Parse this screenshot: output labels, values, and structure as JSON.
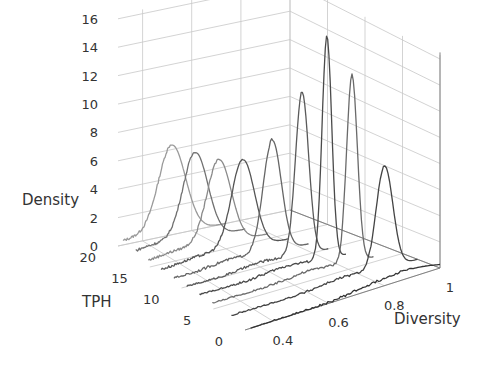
{
  "chart_data": {
    "type": "line",
    "subtype": "3d-waterfall-density",
    "title": "",
    "axes": {
      "z": {
        "label": "Density",
        "ticks": [
          0,
          2,
          4,
          6,
          8,
          10,
          12,
          14,
          16
        ],
        "range": [
          0,
          16.5
        ]
      },
      "y": {
        "label": "TPH",
        "ticks": [
          0,
          5,
          10,
          15,
          20
        ],
        "range": [
          0,
          20
        ]
      },
      "x": {
        "label": "Diversity",
        "ticks": [
          0.4,
          0.6,
          0.8,
          1
        ],
        "range": [
          0.3,
          1.0
        ]
      }
    },
    "grid": true,
    "legend": null,
    "series": [
      {
        "tph": 20,
        "peak_x": 0.52,
        "peak_density": 6.3,
        "width": 0.055,
        "color": "#9a9a9a"
      },
      {
        "tph": 18,
        "peak_x": 0.56,
        "peak_density": 6.2,
        "width": 0.05,
        "color": "#707070"
      },
      {
        "tph": 16,
        "peak_x": 0.6,
        "peak_density": 6.1,
        "width": 0.048,
        "color": "#8a8a8a"
      },
      {
        "tph": 14,
        "peak_x": 0.64,
        "peak_density": 6.5,
        "width": 0.045,
        "color": "#555555"
      },
      {
        "tph": 12,
        "peak_x": 0.7,
        "peak_density": 8.2,
        "width": 0.035,
        "color": "#666666"
      },
      {
        "tph": 10,
        "peak_x": 0.76,
        "peak_density": 12.0,
        "width": 0.025,
        "color": "#5a5a5a"
      },
      {
        "tph": 8,
        "peak_x": 0.8,
        "peak_density": 16.5,
        "width": 0.018,
        "color": "#4a4a4a"
      },
      {
        "tph": 6,
        "peak_x": 0.84,
        "peak_density": 14.0,
        "width": 0.02,
        "color": "#6a6a6a"
      },
      {
        "tph": 3,
        "peak_x": 0.88,
        "peak_density": 7.8,
        "width": 0.03,
        "color": "#444444"
      },
      {
        "tph": 0,
        "peak_x": 0.9,
        "peak_density": 0.6,
        "width": 0.08,
        "color": "#333333"
      }
    ]
  }
}
